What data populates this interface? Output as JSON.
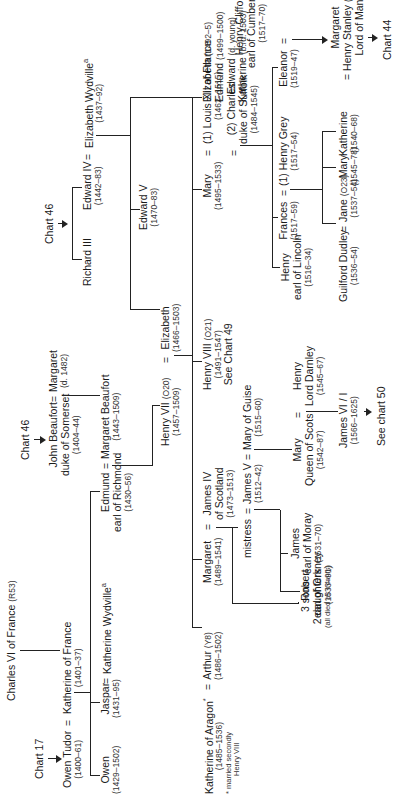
{
  "chart": {
    "orientation": "rotated-90-ccw",
    "people": {
      "charles_vi": {
        "name": "Charles VI of France",
        "ref": "(R53)"
      },
      "chart17": {
        "label": "Chart 17"
      },
      "owen_tudor": {
        "name": "Owen Tudor",
        "dates": "(1400–61)"
      },
      "katherine_france": {
        "name": "Katherine of France",
        "dates": "(1401–37)"
      },
      "chart46a": {
        "label": "Chart 46"
      },
      "john_beaufort": {
        "name": "John Beaufort",
        "title": "duke of Somerset",
        "dates": "(1404–44)"
      },
      "margaret_d1482": {
        "name": "Margaret",
        "dates": "(d. 1482)"
      },
      "owen": {
        "name": "Owen",
        "dates": "(1429–1502)"
      },
      "jaspar": {
        "name": "Jaspar",
        "dates": "(1431–95)"
      },
      "katherine_wydville": {
        "name": "Katherine Wydville",
        "note": "a"
      },
      "edmund_richmond": {
        "name": "Edmund",
        "title": "earl of Richmond",
        "dates": "(1430–56)"
      },
      "margaret_beaufort": {
        "name": "Margaret Beaufort",
        "dates": "(1443–1509)"
      },
      "henry_vii": {
        "name": "Henry VII",
        "ref": "(O20)",
        "dates": "(1457–1509)"
      },
      "elizabeth_york": {
        "name": "Elizabeth",
        "dates": "(1466–1503)"
      },
      "chart46b": {
        "label": "Chart 46"
      },
      "richard_iii": {
        "name": "Richard III"
      },
      "edward_iv": {
        "name": "Edward IV",
        "dates": "(1442–83)"
      },
      "elizabeth_wydville": {
        "name": "Elizabeth Wydville",
        "note": "a",
        "dates": "(1437–92)"
      },
      "edward_v": {
        "name": "Edward V",
        "dates": "(1470–83)"
      },
      "katherine_aragon": {
        "name": "Katherine of Aragon",
        "note": "*",
        "dates": "(1485–1536)",
        "footnote1": "* married secondly",
        "footnote2": "Henry VIII"
      },
      "arthur": {
        "name": "Arthur",
        "ref": "(Y8)",
        "dates": "(1486–1502)"
      },
      "margaret_tudor": {
        "name": "Margaret",
        "dates": "(1489–1541)"
      },
      "james_iv": {
        "name": "James IV",
        "title": "of Scotland",
        "dates": "(1473–1513)"
      },
      "henry_viii": {
        "name": "Henry VIII",
        "ref": "(O21)",
        "dates": "(1491–1547)",
        "see": "See Chart 49"
      },
      "mary_tudor": {
        "name": "Mary",
        "dates": "(1495–1533)"
      },
      "louis_xii": {
        "name": "(1) Louis XII of France",
        "dates": "(1462–1515)"
      },
      "charles_suffolk": {
        "name": "(2) Charles",
        "title": "duke of Suffolk",
        "dates": "(1484–1545)"
      },
      "sisters": {
        "l1": "Elizabeth",
        "d1": "(1492–5)",
        "l2": "Edmund",
        "d2": "(1499–1500)",
        "l3": "Edward",
        "d3": "(d. young)",
        "l4": "Katherine",
        "d4": "(b./d. 1503)"
      },
      "three_sons": {
        "l1": "3 sons",
        "l2": "2 daughters",
        "l3": "(all died as infants)"
      },
      "mistress": {
        "name": "mistress"
      },
      "james_v": {
        "name": "James V",
        "dates": "(1512–42)"
      },
      "mary_guise": {
        "name": "Mary of Guise",
        "dates": "(1515–60)"
      },
      "robert_orkney": {
        "name": "Robert",
        "title": "earl of Orkney",
        "dates": "(1533–91)"
      },
      "james_moray": {
        "name": "James",
        "title": "earl of Moray",
        "dates": "(1531–70)"
      },
      "mary_scots": {
        "name": "Mary",
        "title": "Queen of Scots",
        "dates": "(1542–87)"
      },
      "henry_darnley": {
        "name": "Henry",
        "title": "Lord Darnley",
        "dates": "(1545–67)"
      },
      "james_vi": {
        "name": "James VI / I",
        "dates": "(1566–1625)"
      },
      "see_chart50": {
        "label": "See chart 50"
      },
      "henry_lincoln": {
        "name": "Henry",
        "title": "earl of Lincoln",
        "dates": "(1516–34)"
      },
      "frances": {
        "name": "Frances",
        "dates": "(1517–59)"
      },
      "henry_grey": {
        "name": "(1) Henry Grey",
        "dates": "(1517–54)"
      },
      "eleanor": {
        "name": "Eleanor",
        "dates": "(1519–47)"
      },
      "henry_clifford": {
        "name": "Henry Clifford",
        "title": "earl of Cumberland",
        "dates": "(1517–70)"
      },
      "guilford": {
        "name": "Guilford Dudley",
        "dates": "(1536–54)"
      },
      "jane": {
        "name": "Jane",
        "ref": "(O23)",
        "dates": "(1537–54)"
      },
      "mary_grey": {
        "name": "Mary",
        "dates": "(1545–78)"
      },
      "katherine_grey": {
        "name": "Katherine",
        "dates": "(1540–68)"
      },
      "margaret_clifford": {
        "name": "Margaret",
        "spouse": "= Henry Stanley",
        "ref": "(NA59)",
        "title": "Lord of Man"
      },
      "chart44": {
        "label": "Chart 44"
      }
    },
    "symbols": {
      "eq": "="
    },
    "line_color": "#222222"
  }
}
